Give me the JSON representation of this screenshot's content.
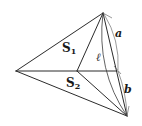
{
  "diagram": {
    "type": "geometric-figure",
    "vertices": {
      "apex": [
        103,
        13
      ],
      "left": [
        16,
        71
      ],
      "center": [
        77,
        71
      ],
      "right_mid": [
        117,
        71
      ],
      "bottom": [
        127,
        116
      ]
    },
    "labels": {
      "S1": {
        "main": "S",
        "sub": "1"
      },
      "S2": {
        "main": "S",
        "sub": "2"
      },
      "a": "a",
      "b": "b",
      "ell": "ℓ"
    },
    "colors": {
      "line": "#2b2b2b",
      "text": "#1a1a1a",
      "background": "#ffffff"
    }
  }
}
